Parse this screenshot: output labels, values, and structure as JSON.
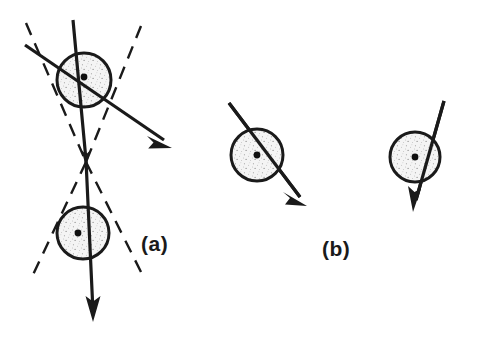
{
  "figure": {
    "width": 489,
    "height": 342,
    "background_color": "#ffffff",
    "stroke_color": "#1a1a1a",
    "fill_color": "#f2f2f2",
    "speckle_color": "#8a8a8a",
    "type": "physics-scattering-diagram"
  },
  "panels": [
    {
      "id": "a",
      "label": "(a)",
      "label_position": {
        "x": 141,
        "y": 232
      },
      "description": "Two shaded circles on a common vertical axis with a converging-diverging dashed cone and a deflected solid ray"
    },
    {
      "id": "b",
      "label": "(b)",
      "label_position": {
        "x": 322,
        "y": 237
      },
      "description": "Two separate shaded circles each crossed by a single straight solid ray"
    }
  ],
  "circles": [
    {
      "name": "panel-a-upper-circle",
      "cx": 84,
      "cy": 80,
      "r": 27
    },
    {
      "name": "panel-a-lower-circle",
      "cx": 83,
      "cy": 233,
      "r": 26
    },
    {
      "name": "panel-b-left-circle",
      "cx": 257,
      "cy": 155,
      "r": 26
    },
    {
      "name": "panel-b-right-circle",
      "cx": 415,
      "cy": 157,
      "r": 25
    }
  ],
  "center_dots": [
    {
      "name": "panel-a-upper-center-dot",
      "cx": 84,
      "cy": 77,
      "r": 3.4
    },
    {
      "name": "panel-a-lower-center-dot",
      "cx": 78,
      "cy": 233,
      "r": 3.4
    },
    {
      "name": "panel-b-left-center-dot",
      "cx": 257,
      "cy": 155,
      "r": 3.4
    },
    {
      "name": "panel-b-right-center-dot",
      "cx": 415,
      "cy": 157,
      "r": 3.4
    }
  ],
  "solid_rays": [
    {
      "name": "panel-a-vertical-ray",
      "points": "73,20 86,160 93,312",
      "arrowheads": [
        {
          "at": [
            86,
            162
          ],
          "angle": 87
        },
        {
          "at": [
            93,
            318
          ],
          "angle": 92
        }
      ]
    },
    {
      "name": "panel-a-deflected-ray",
      "points": "25,45 168,143",
      "arrowheads": [
        {
          "at": [
            168,
            143
          ],
          "angle": 34
        }
      ]
    },
    {
      "name": "panel-b-left-ray",
      "points": "229,103 304,202",
      "arrowheads": [
        {
          "at": [
            304,
            202
          ],
          "angle": 53
        }
      ]
    },
    {
      "name": "panel-b-right-ray",
      "points": "444,101 414,209",
      "arrowheads": [
        {
          "at": [
            414,
            209
          ],
          "angle": 105
        }
      ]
    }
  ],
  "dashed_lines": [
    {
      "name": "dashed-cone-upper-left",
      "x1": 26,
      "y1": 23,
      "x2": 86,
      "y2": 162
    },
    {
      "name": "dashed-cone-upper-right",
      "x1": 141,
      "y1": 26,
      "x2": 86,
      "y2": 162
    },
    {
      "name": "dashed-cone-lower-left",
      "x1": 86,
      "y1": 162,
      "x2": 32,
      "y2": 277
    },
    {
      "name": "dashed-cone-lower-right",
      "x1": 86,
      "y1": 162,
      "x2": 141,
      "y2": 272
    }
  ]
}
